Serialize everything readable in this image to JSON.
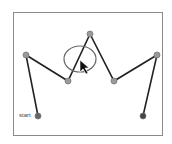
{
  "diagram": {
    "frame": {
      "x": 13,
      "y": 12,
      "w": 150,
      "h": 124
    },
    "start_label": "start",
    "path_points": [
      {
        "x": 38,
        "y": 116,
        "fill": "#666666"
      },
      {
        "x": 26,
        "y": 55,
        "fill": "#9a9a9a"
      },
      {
        "x": 68,
        "y": 81,
        "fill": "#9a9a9a"
      },
      {
        "x": 90,
        "y": 34,
        "fill": "#9a9a9a"
      },
      {
        "x": 114,
        "y": 81,
        "fill": "#9a9a9a"
      },
      {
        "x": 157,
        "y": 55,
        "fill": "#9a9a9a"
      },
      {
        "x": 143,
        "y": 116,
        "fill": "#444444"
      }
    ],
    "line_color": "#222222",
    "selection_ellipse": {
      "cx": 80,
      "cy": 59,
      "rx": 16,
      "ry": 13,
      "color": "#666666"
    },
    "cursor": {
      "x": 80,
      "y": 60,
      "icon": "arrow-cursor-icon"
    }
  }
}
